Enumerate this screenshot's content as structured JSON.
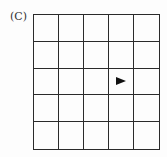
{
  "figure": {
    "label": "(C)",
    "grid": {
      "rows": 5,
      "cols": 5,
      "line_color": "#2a2a2a"
    },
    "marker": {
      "type": "arrow-right-icon",
      "direction": "right",
      "row": 3,
      "col": 4,
      "color": "#111111"
    }
  }
}
